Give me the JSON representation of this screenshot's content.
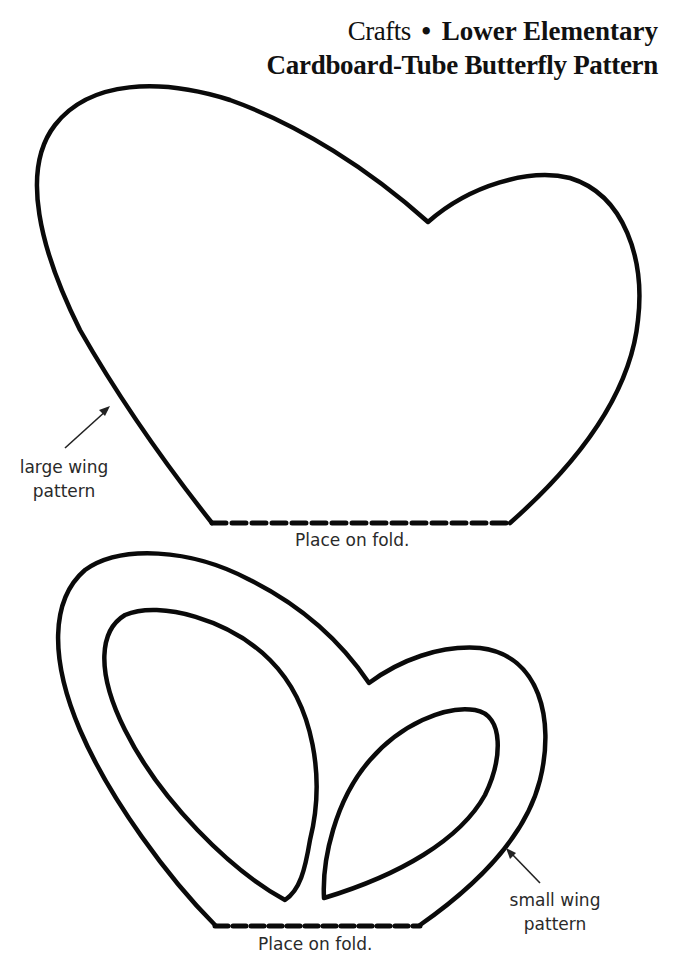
{
  "header": {
    "category": "Crafts",
    "separator": "•",
    "level": "Lower Elementary",
    "title": "Cardboard-Tube Butterfly Pattern"
  },
  "large_wing": {
    "label_line1": "large wing",
    "label_line2": "pattern",
    "fold_label": "Place on fold."
  },
  "small_wing": {
    "label_line1": "small wing",
    "label_line2": "pattern",
    "fold_label": "Place on fold."
  },
  "colors": {
    "line": "#0a0a0a",
    "background": "#ffffff"
  }
}
